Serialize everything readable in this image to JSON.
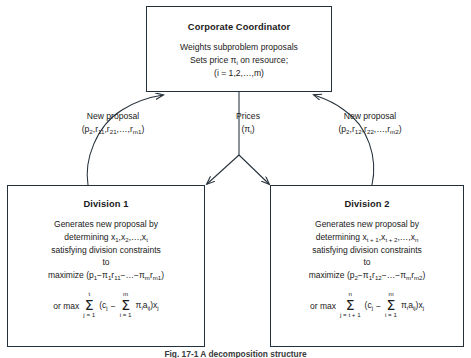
{
  "figure": {
    "caption": "Fig. 17-1  A decomposition structure"
  },
  "coordinator": {
    "title": "Corporate Coordinator",
    "line1": "Weights subproblem proposals",
    "line2_pre": "Sets price ",
    "line2_sym": "π",
    "line2_sub": "i",
    "line2_post": " on resource;",
    "line3": "(i = 1,2,…,m)"
  },
  "edges": {
    "left": {
      "label": "New proposal",
      "expr": "(p₂,r₁₁,r₂₁,…,rₘ₁)",
      "expr_parts": {
        "p": "p",
        "p_sub": "2",
        "r1": "r",
        "r1_sub": "11",
        "r2": "r",
        "r2_sub": "21",
        "dots": ",…,",
        "r3": "r",
        "r3_sub": "m1"
      }
    },
    "center": {
      "label": "Prices",
      "expr": "(πᵢ)",
      "sym": "π",
      "sym_sub": "i"
    },
    "right": {
      "label": "New proposal",
      "expr": "(p₂,r₁₂,r₂₂,…,rₘ₂)",
      "expr_parts": {
        "p": "p",
        "p_sub": "2",
        "r1": "r",
        "r1_sub": "12",
        "r2": "r",
        "r2_sub": "22",
        "dots": ",…,",
        "r3": "r",
        "r3_sub": "m2"
      }
    }
  },
  "division1": {
    "title": "Division 1",
    "line1": "Generates new proposal by",
    "line2_pre": "determining x",
    "line2_sub1": "1",
    "line2_mid": ",x",
    "line2_sub2": "2",
    "line2_dots": ",…,x",
    "line2_sub3": "t",
    "line3": "satisfying division constraints",
    "line4": "to",
    "maximize_pre": "maximize (p",
    "maximize_sub1": "1",
    "maximize_minus": "−",
    "maximize_pi1": "π",
    "maximize_pi1_sub": "1",
    "maximize_r1": "r",
    "maximize_r1_sub": "11",
    "maximize_dots": "−…−",
    "maximize_pim": "π",
    "maximize_pim_sub": "m",
    "maximize_rm": "r",
    "maximize_rm_sub": "m1",
    "maximize_close": ")",
    "sum_prefix": "or max",
    "sum1_top": "t",
    "sum1_bot": "j = 1",
    "sum_open": "(c",
    "sum_c_sub": "j",
    "sum_minus": "−",
    "sum2_top": "m",
    "sum2_bot": "i = 1",
    "sum_pi": "π",
    "sum_pi_sub": "i",
    "sum_a": "a",
    "sum_a_sub": "ij",
    "sum_close": ")x",
    "sum_x_sub": "j"
  },
  "division2": {
    "title": "Division 2",
    "line1": "Generates new proposal by",
    "line2_pre": "determining x",
    "line2_sub1": "t + 1",
    "line2_mid": ",x",
    "line2_sub2": "t + 2",
    "line2_dots": ",…,x",
    "line2_sub3": "n",
    "line3": "satisfying division constraints",
    "line4": "to",
    "maximize_pre": "maximize (p",
    "maximize_sub1": "2",
    "maximize_minus": "−",
    "maximize_pi1": "π",
    "maximize_pi1_sub": "1",
    "maximize_r1": "r",
    "maximize_r1_sub": "12",
    "maximize_dots": "−…−",
    "maximize_pim": "π",
    "maximize_pim_sub": "m",
    "maximize_rm": "r",
    "maximize_rm_sub": "m2",
    "maximize_close": ")",
    "sum_prefix": "or max",
    "sum1_top": "n",
    "sum1_bot": "j = t + 1",
    "sum_open": "(c",
    "sum_c_sub": "j",
    "sum_minus": "−",
    "sum2_top": "m",
    "sum2_bot": "i = 1",
    "sum_pi": "π",
    "sum_pi_sub": "i",
    "sum_a": "a",
    "sum_a_sub": "ij",
    "sum_close": ")x",
    "sum_x_sub": "j"
  },
  "colors": {
    "stroke": "#24303a",
    "text": "#1a1a1a",
    "background": "#ffffff"
  }
}
